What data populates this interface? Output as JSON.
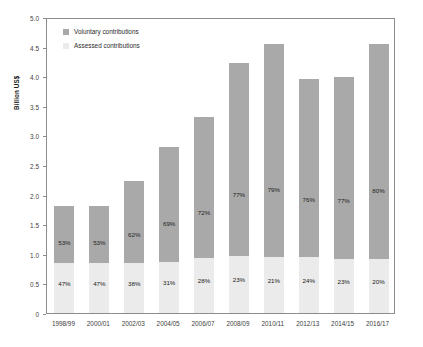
{
  "chart_data": {
    "type": "bar",
    "subtype": "stacked-bar",
    "title": "",
    "xlabel": "",
    "ylabel": "Billion US$",
    "ylim": [
      0,
      5.0
    ],
    "ytick_values": [
      0,
      0.5,
      1.0,
      1.5,
      2.0,
      2.5,
      3.0,
      3.5,
      4.0,
      4.5,
      5.0
    ],
    "ytick_labels": [
      "0",
      "0.5",
      "1.0",
      "1.5",
      "2.0",
      "2.5",
      "3.0",
      "3.5",
      "4.0",
      "4.5",
      "5.0"
    ],
    "grid": false,
    "legend_position": "top-left",
    "categories": [
      "1998/99",
      "2000/01",
      "2002/03",
      "2004/05",
      "2006/07",
      "2008/09",
      "2010/11",
      "2012/13",
      "2014/15",
      "2016/17"
    ],
    "series": [
      {
        "name": "Assessed contributions",
        "color": "#ebebeb",
        "values": [
          0.85,
          0.85,
          0.85,
          0.87,
          0.93,
          0.97,
          0.95,
          0.95,
          0.92,
          0.91
        ],
        "labels": [
          "47%",
          "47%",
          "38%",
          "31%",
          "28%",
          "23%",
          "21%",
          "24%",
          "23%",
          "20%"
        ]
      },
      {
        "name": "Voluntary contributions",
        "color": "#a9a9a9",
        "values": [
          0.96,
          0.96,
          1.38,
          1.94,
          2.38,
          3.26,
          3.59,
          3.01,
          3.06,
          3.64
        ],
        "labels": [
          "53%",
          "53%",
          "62%",
          "69%",
          "72%",
          "77%",
          "79%",
          "76%",
          "77%",
          "80%"
        ]
      }
    ],
    "totals": [
      1.81,
      1.81,
      2.23,
      2.81,
      3.31,
      4.23,
      4.54,
      3.96,
      3.98,
      4.55
    ]
  },
  "legend": {
    "items": [
      {
        "label": "Voluntary contributions",
        "color": "#a9a9a9"
      },
      {
        "label": "Assessed contributions",
        "color": "#ebebeb"
      }
    ]
  },
  "axes": {
    "y_title": "Billion US$"
  }
}
